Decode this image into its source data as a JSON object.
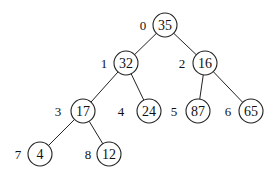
{
  "diagram": {
    "type": "binary-tree (array-indexed heap)",
    "nodes": [
      {
        "index": "0",
        "value": "35",
        "x": 165,
        "y": 25,
        "ix": 143
      },
      {
        "index": "1",
        "value": "32",
        "x": 126,
        "y": 63,
        "ix": 104
      },
      {
        "index": "2",
        "value": "16",
        "x": 205,
        "y": 63,
        "ix": 182
      },
      {
        "index": "3",
        "value": "17",
        "x": 83,
        "y": 111,
        "ix": 58
      },
      {
        "index": "4",
        "value": "24",
        "x": 149,
        "y": 111,
        "ix": 121
      },
      {
        "index": "5",
        "value": "87",
        "x": 198,
        "y": 111,
        "ix": 174
      },
      {
        "index": "6",
        "value": "65",
        "x": 251,
        "y": 111,
        "ix": 228
      },
      {
        "index": "7",
        "value": "4",
        "x": 40,
        "y": 154,
        "ix": 18
      },
      {
        "index": "8",
        "value": "12",
        "x": 109,
        "y": 154,
        "ix": 88
      }
    ],
    "edges": [
      [
        0,
        1
      ],
      [
        0,
        2
      ],
      [
        1,
        3
      ],
      [
        1,
        4
      ],
      [
        2,
        5
      ],
      [
        2,
        6
      ],
      [
        3,
        7
      ],
      [
        3,
        8
      ]
    ],
    "radius": 12
  }
}
